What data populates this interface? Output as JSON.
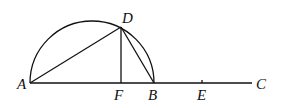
{
  "diagram": {
    "type": "geometry",
    "stroke_color": "#111111",
    "background": "#ffffff",
    "points": {
      "A": {
        "label": "A",
        "x": 30,
        "y": 83
      },
      "D": {
        "label": "D",
        "x": 121,
        "y": 27
      },
      "F": {
        "label": "F",
        "x": 121,
        "y": 83
      },
      "B": {
        "label": "B",
        "x": 154,
        "y": 83
      },
      "E": {
        "label": "E",
        "x": 202,
        "y": 83
      },
      "C": {
        "label": "C",
        "x": 252,
        "y": 83
      }
    },
    "segments": [
      {
        "from": "A",
        "to": "C",
        "name": "line-ac"
      },
      {
        "from": "A",
        "to": "D",
        "name": "segment-ad"
      },
      {
        "from": "D",
        "to": "F",
        "name": "segment-df"
      },
      {
        "from": "D",
        "to": "B",
        "name": "segment-db"
      }
    ],
    "arc": {
      "name": "semicircle-ab",
      "center_x": 92,
      "center_y": 83,
      "radius": 62
    }
  }
}
